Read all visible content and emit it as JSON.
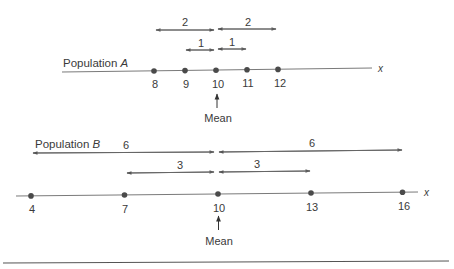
{
  "figure": {
    "bottom_rule": true
  },
  "colors": {
    "line": "#7a7a7a",
    "point": "#4a4a4a",
    "text": "#3a3a3a",
    "background": "#ffffff"
  },
  "populations": [
    {
      "id": "A",
      "label_prefix": "Population ",
      "label_var": "A",
      "axis_var": "x",
      "values": [
        8,
        9,
        10,
        11,
        12
      ],
      "tick_labels": [
        "8",
        "9",
        "10",
        "11",
        "12"
      ],
      "mean": 10,
      "mean_label": "Mean",
      "distance_arrows": [
        {
          "from": 8,
          "to": 10,
          "label": "2",
          "row": "outer"
        },
        {
          "from": 10,
          "to": 12,
          "label": "2",
          "row": "outer"
        },
        {
          "from": 9,
          "to": 10,
          "label": "1",
          "row": "inner"
        },
        {
          "from": 10,
          "to": 11,
          "label": "1",
          "row": "inner"
        }
      ]
    },
    {
      "id": "B",
      "label_prefix": "Population ",
      "label_var": "B",
      "axis_var": "x",
      "values": [
        4,
        7,
        10,
        13,
        16
      ],
      "tick_labels": [
        "4",
        "7",
        "10",
        "13",
        "16"
      ],
      "mean": 10,
      "mean_label": "Mean",
      "distance_arrows": [
        {
          "from": 4,
          "to": 10,
          "label": "6",
          "row": "outer"
        },
        {
          "from": 10,
          "to": 16,
          "label": "6",
          "row": "outer"
        },
        {
          "from": 7,
          "to": 10,
          "label": "3",
          "row": "inner"
        },
        {
          "from": 10,
          "to": 13,
          "label": "3",
          "row": "inner"
        }
      ]
    }
  ],
  "labels": {
    "popA_prefix": "Population ",
    "popA_var": "A",
    "popB_prefix": "Population ",
    "popB_var": "B",
    "x_var": "x",
    "mean": "Mean",
    "A_outer_left": "2",
    "A_outer_right": "2",
    "A_inner_left": "1",
    "A_inner_right": "1",
    "B_outer_left": "6",
    "B_outer_right": "6",
    "B_inner_left": "3",
    "B_inner_right": "3",
    "A_ticks": [
      "8",
      "9",
      "10",
      "11",
      "12"
    ],
    "B_ticks": [
      "4",
      "7",
      "10",
      "13",
      "16"
    ]
  }
}
